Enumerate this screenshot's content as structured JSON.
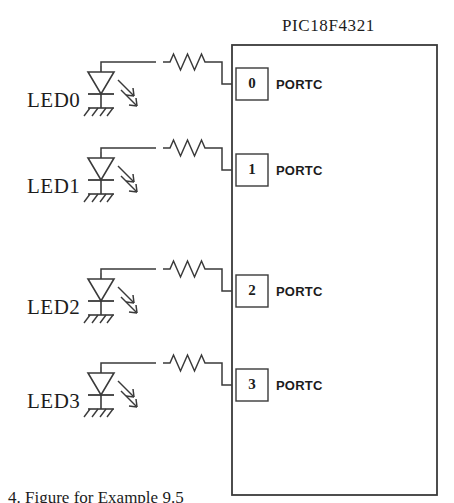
{
  "figure": {
    "type": "circuit-schematic",
    "background_color": "#ffffff",
    "line_color": "#3a3a3a",
    "text_color": "#1c1c1c"
  },
  "chip": {
    "title": "PIC18F4321",
    "box": {
      "x": 232,
      "y": 45,
      "width": 205,
      "height": 450
    },
    "pins": [
      {
        "number": "0",
        "port_label": "PORTC",
        "y": 84
      },
      {
        "number": "1",
        "port_label": "PORTC",
        "y": 170
      },
      {
        "number": "2",
        "port_label": "PORTC",
        "y": 291
      },
      {
        "number": "3",
        "port_label": "PORTC",
        "y": 385
      }
    ]
  },
  "branches": [
    {
      "label": "LED0",
      "pin": "0",
      "y": 84,
      "component": "led",
      "series": "resistor"
    },
    {
      "label": "LED1",
      "pin": "1",
      "y": 170,
      "component": "led",
      "series": "resistor"
    },
    {
      "label": "LED2",
      "pin": "2",
      "y": 291,
      "component": "led",
      "series": "resistor"
    },
    {
      "label": "LED3",
      "pin": "3",
      "y": 385,
      "component": "led",
      "series": "resistor"
    }
  ],
  "symbols": {
    "led": "light-emitting-diode",
    "resistor": "resistor-zigzag",
    "ground": "ground-hatch"
  },
  "caption": {
    "text": "4. Figure for Example 9.5"
  }
}
